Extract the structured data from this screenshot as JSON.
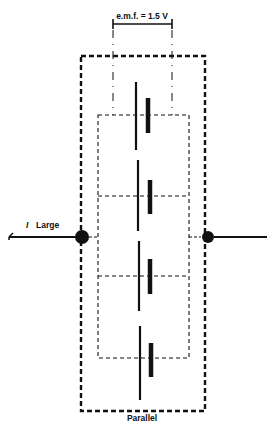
{
  "diagram": {
    "type": "circuit",
    "title": "Parallel",
    "emf_label": "e.m.f. = 1.5 V",
    "current_symbol": "I",
    "current_label": "Large",
    "cells": [
      {
        "id": 1,
        "label": "cell"
      },
      {
        "id": 2,
        "label": "cell"
      },
      {
        "id": 3,
        "label": "cell"
      },
      {
        "id": 4,
        "label": "cell"
      }
    ],
    "cell_count": 4,
    "connection": "parallel",
    "colors": {
      "ink": "#111111",
      "background": "#ffffff"
    }
  }
}
